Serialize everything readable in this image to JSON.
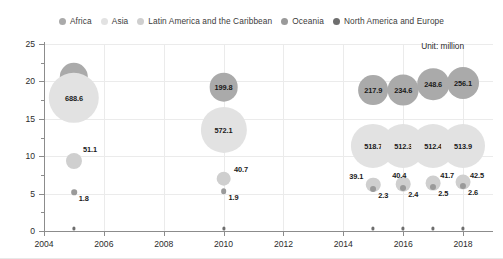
{
  "legend": {
    "position": "top-center",
    "items": [
      {
        "label": "Africa",
        "color": "#aaaaaa"
      },
      {
        "label": "Asia",
        "color": "#e2e2e2"
      },
      {
        "label": "Latin America and the Caribbean",
        "color": "#cfcfcf"
      },
      {
        "label": "Oceania",
        "color": "#9a9a9a"
      },
      {
        "label": "North America and Europe",
        "color": "#6e6e6e"
      }
    ]
  },
  "annotation": {
    "unit_note": "Unit: million"
  },
  "axes": {
    "y_title": "Percent of undernourishment",
    "y_ticks": [
      "0",
      "5",
      "10",
      "15",
      "20",
      "25"
    ],
    "x_ticks": [
      "2004",
      "2006",
      "2008",
      "2010",
      "2012",
      "2014",
      "2016",
      "2018"
    ]
  },
  "chart_data": {
    "type": "scatter",
    "title": "",
    "xlabel": "",
    "ylabel": "Percent of undernourishment",
    "xlim": [
      2004,
      2019
    ],
    "ylim": [
      0,
      25
    ],
    "grid": true,
    "legend_position": "top-center",
    "size_unit": "million",
    "size_note": "Bubble area encodes number of undernourished people (millions)",
    "x": [
      2005,
      2010,
      2015,
      2016,
      2017,
      2018
    ],
    "series": [
      {
        "name": "Africa",
        "color": "#aaaaaa",
        "points": [
          {
            "x": 2005,
            "y": 20.6,
            "size": 196.0,
            "label": "196.0"
          },
          {
            "x": 2010,
            "y": 19.2,
            "size": 199.8,
            "label": "199.8"
          },
          {
            "x": 2015,
            "y": 18.8,
            "size": 217.9,
            "label": "217.9"
          },
          {
            "x": 2016,
            "y": 18.8,
            "size": 234.6,
            "label": "234.6"
          },
          {
            "x": 2017,
            "y": 19.6,
            "size": 248.6,
            "label": "248.6"
          },
          {
            "x": 2018,
            "y": 19.8,
            "size": 256.1,
            "label": "256.1"
          }
        ]
      },
      {
        "name": "Asia",
        "color": "#e2e2e2",
        "points": [
          {
            "x": 2005,
            "y": 17.8,
            "size": 688.6,
            "label": "688.6"
          },
          {
            "x": 2010,
            "y": 13.5,
            "size": 572.1,
            "label": "572.1"
          },
          {
            "x": 2015,
            "y": 11.4,
            "size": 518.7,
            "label": "518.7"
          },
          {
            "x": 2016,
            "y": 11.3,
            "size": 512.3,
            "label": "512.3"
          },
          {
            "x": 2017,
            "y": 11.3,
            "size": 512.4,
            "label": "512.4"
          },
          {
            "x": 2018,
            "y": 11.3,
            "size": 513.9,
            "label": "513.9"
          }
        ]
      },
      {
        "name": "Latin America and the Caribbean",
        "color": "#cfcfcf",
        "points": [
          {
            "x": 2005,
            "y": 9.4,
            "size": 51.1,
            "label": "51.1"
          },
          {
            "x": 2010,
            "y": 7.0,
            "size": 40.7,
            "label": "40.7"
          },
          {
            "x": 2015,
            "y": 6.2,
            "size": 39.1,
            "label": "39.1"
          },
          {
            "x": 2016,
            "y": 6.3,
            "size": 40.4,
            "label": "40.4"
          },
          {
            "x": 2017,
            "y": 6.4,
            "size": 41.7,
            "label": "41.7"
          },
          {
            "x": 2018,
            "y": 6.5,
            "size": 42.5,
            "label": "42.5"
          }
        ]
      },
      {
        "name": "Oceania",
        "color": "#9a9a9a",
        "points": [
          {
            "x": 2005,
            "y": 5.2,
            "size": 1.8,
            "label": "1.8"
          },
          {
            "x": 2010,
            "y": 5.3,
            "size": 1.9,
            "label": "1.9"
          },
          {
            "x": 2015,
            "y": 5.6,
            "size": 2.3,
            "label": "2.3"
          },
          {
            "x": 2016,
            "y": 5.7,
            "size": 2.4,
            "label": "2.4"
          },
          {
            "x": 2017,
            "y": 5.9,
            "size": 2.5,
            "label": "2.5"
          },
          {
            "x": 2018,
            "y": 6.0,
            "size": 2.6,
            "label": "2.6"
          }
        ]
      },
      {
        "name": "North America and Europe",
        "color": "#6e6e6e",
        "points": [
          {
            "x": 2005,
            "y": 0.35,
            "size": 0,
            "label": ""
          },
          {
            "x": 2010,
            "y": 0.35,
            "size": 0,
            "label": ""
          },
          {
            "x": 2015,
            "y": 0.35,
            "size": 0,
            "label": ""
          },
          {
            "x": 2016,
            "y": 0.35,
            "size": 0,
            "label": ""
          },
          {
            "x": 2017,
            "y": 0.35,
            "size": 0,
            "label": ""
          },
          {
            "x": 2018,
            "y": 0.35,
            "size": 0,
            "label": ""
          }
        ]
      }
    ]
  }
}
